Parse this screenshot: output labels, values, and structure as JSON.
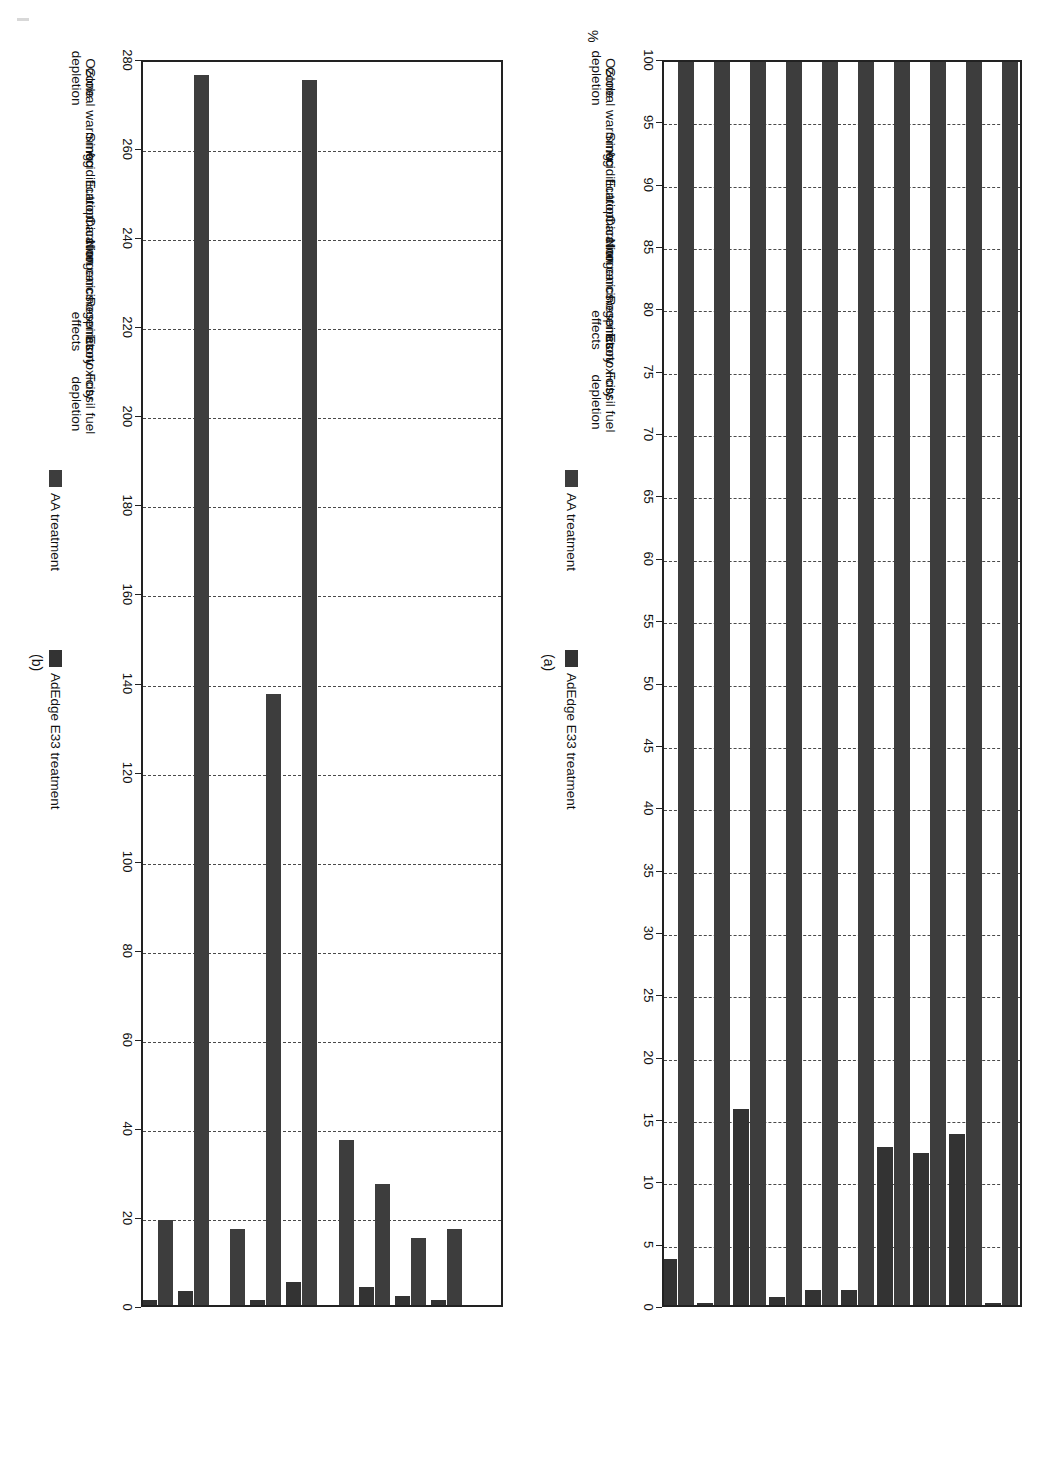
{
  "figure": {
    "panels": [
      {
        "caption": "(a)",
        "axis_title": "%",
        "ticks": [
          100,
          95,
          90,
          85,
          80,
          75,
          70,
          65,
          60,
          55,
          50,
          45,
          40,
          35,
          30,
          25,
          20,
          15,
          10,
          5,
          0
        ],
        "legend": [
          {
            "label": "AA treatment",
            "color": "#3d3d3d"
          },
          {
            "label": "AdEdge E33 treatment",
            "color": "#333333"
          }
        ]
      },
      {
        "caption": "(b)",
        "axis_title": "",
        "ticks": [
          280,
          260,
          240,
          220,
          200,
          180,
          160,
          140,
          120,
          100,
          80,
          60,
          40,
          20,
          0
        ],
        "legend": [
          {
            "label": "AA treatment",
            "color": "#3d3d3d"
          },
          {
            "label": "AdEdge E33 treatment",
            "color": "#333333"
          }
        ]
      }
    ]
  },
  "chart_data": [
    {
      "type": "bar",
      "title": "",
      "subcaption": "(a)",
      "orientation": "vertical",
      "xlabel": "",
      "ylabel": "%",
      "ylim": [
        0,
        100
      ],
      "ytick_step": 5,
      "grid": true,
      "legend_position": "bottom",
      "categories": [
        "Ozone depletion",
        "Global warming",
        "Smog",
        "Acidification",
        "Eutrophication",
        "Carcinogenics",
        "Non carcinogenics",
        "Respiratory effects",
        "Ecotoxicity",
        "Fossil fuel depletion"
      ],
      "series": [
        {
          "name": "AA treatment",
          "color": "#3d3d3d",
          "values": [
            100,
            100,
            100,
            100,
            100,
            100,
            100,
            100,
            100,
            100
          ]
        },
        {
          "name": "AdEdge E33 treatment",
          "color": "#333333",
          "values": [
            0.5,
            14,
            12.5,
            13,
            1.5,
            1.5,
            1,
            16,
            0.5,
            4
          ]
        }
      ]
    },
    {
      "type": "bar",
      "title": "",
      "subcaption": "(b)",
      "orientation": "vertical",
      "xlabel": "",
      "ylabel": "",
      "ylim": [
        0,
        280
      ],
      "ytick_step": 20,
      "grid": true,
      "legend_position": "bottom",
      "categories": [
        "Ozone depletion",
        "Global warming",
        "Smog",
        "Acidification",
        "Eutrophication",
        "Carcinogenics",
        "Non carcinogenics",
        "Respiratory effects",
        "Ecotoxicity",
        "Fossil fuel depletion"
      ],
      "series": [
        {
          "name": "AA treatment",
          "color": "#3d3d3d",
          "values": [
            0,
            18,
            16,
            28,
            38,
            276,
            138,
            18,
            277,
            20
          ]
        },
        {
          "name": "AdEdge E33 treatment",
          "color": "#333333",
          "values": [
            0,
            2,
            3,
            5,
            1,
            6,
            2,
            1,
            4,
            2
          ]
        }
      ]
    }
  ]
}
